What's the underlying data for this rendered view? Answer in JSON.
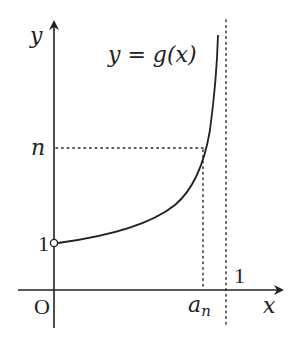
{
  "diagram": {
    "curve_label": "y = g(x)",
    "axes": {
      "x_label": "x",
      "y_label": "y",
      "origin_label": "O"
    },
    "y_ticks": [
      {
        "label": "n",
        "note": "horizontal dotted guide at y = n"
      },
      {
        "label": "1",
        "note": "open circle at (0, 1)"
      }
    ],
    "x_ticks": [
      {
        "label": "a_n",
        "label_base": "a",
        "label_sub": "n",
        "note": "vertical dotted guide from curve to x-axis"
      },
      {
        "label": "1",
        "note": "vertical dotted asymptote x = 1"
      }
    ],
    "colors": {
      "stroke": "#222222",
      "background": "#ffffff"
    }
  }
}
